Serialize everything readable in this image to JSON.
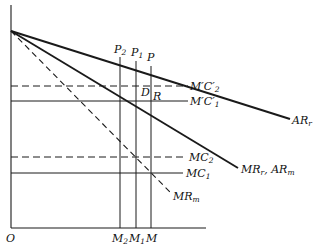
{
  "diagram": {
    "type": "economics-price-output-diagram",
    "origin_label": "O",
    "colors": {
      "ink": "#1a1a1a",
      "background": "#ffffff"
    },
    "curves": {
      "ar_r": {
        "label": "AR",
        "sub": "r",
        "style": "solid-thick"
      },
      "mr_r_ar_m": {
        "label_a": "MR",
        "sub_a": "r",
        "sep": ", ",
        "label_b": "AR",
        "sub_b": "m",
        "style": "solid-thick"
      },
      "mr_m": {
        "label": "MR",
        "sub": "m",
        "style": "dashed"
      }
    },
    "horizontal_lines": {
      "mpc2": {
        "label": "M′C′",
        "sub": "2",
        "style": "dashed"
      },
      "mpc1": {
        "label": "M′C′",
        "sub": "1",
        "style": "solid"
      },
      "mc2": {
        "label": "MC",
        "sub": "2",
        "style": "dashed"
      },
      "mc1": {
        "label": "MC",
        "sub": "1",
        "style": "solid"
      }
    },
    "points": {
      "p2": {
        "label": "P",
        "sub": "2"
      },
      "p1": {
        "label": "P",
        "sub": "1"
      },
      "p": {
        "label": "P"
      },
      "d": {
        "label": "D"
      },
      "r": {
        "label": "R"
      }
    },
    "x_axis_labels": {
      "m2": {
        "label": "M",
        "sub": "2"
      },
      "m1": {
        "label": "M",
        "sub": "1"
      },
      "m": {
        "label": "M"
      }
    }
  }
}
